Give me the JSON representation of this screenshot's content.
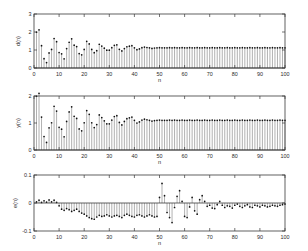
{
  "figure": {
    "background": "#ffffff",
    "axis_color": "#3a3a3a",
    "stem_color": "#6f6f6f",
    "marker_color": "#111111"
  },
  "chart_data": [
    {
      "type": "line",
      "name": "desired-signal",
      "title": "",
      "xlabel": "n",
      "ylabel": "d(n)",
      "xlim": [
        0,
        100
      ],
      "ylim": [
        0,
        3
      ],
      "xticks": [
        0,
        10,
        20,
        30,
        40,
        50,
        60,
        70,
        80,
        90,
        100
      ],
      "xticklabels": [
        "0",
        "10",
        "20",
        "30",
        "40",
        "50",
        "60",
        "70",
        "80",
        "90",
        "100"
      ],
      "yticks": [
        0,
        1,
        2,
        3
      ],
      "yticklabels": [
        "0",
        "1",
        "2",
        "3"
      ],
      "grid": false,
      "legend": "none",
      "marker": "dot",
      "x": [
        1,
        2,
        3,
        4,
        5,
        6,
        7,
        8,
        9,
        10,
        11,
        12,
        13,
        14,
        15,
        16,
        17,
        18,
        19,
        20,
        21,
        22,
        23,
        24,
        25,
        26,
        27,
        28,
        29,
        30,
        31,
        32,
        33,
        34,
        35,
        36,
        37,
        38,
        39,
        40,
        41,
        42,
        43,
        44,
        45,
        46,
        47,
        48,
        49,
        50,
        51,
        52,
        53,
        54,
        55,
        56,
        57,
        58,
        59,
        60,
        61,
        62,
        63,
        64,
        65,
        66,
        67,
        68,
        69,
        70,
        71,
        72,
        73,
        74,
        75,
        76,
        77,
        78,
        79,
        80,
        81,
        82,
        83,
        84,
        85,
        86,
        87,
        88,
        89,
        90,
        91,
        92,
        93,
        94,
        95,
        96,
        97,
        98,
        99,
        100
      ],
      "values": [
        1.99,
        2.12,
        1.24,
        0.52,
        0.3,
        0.84,
        1.03,
        1.64,
        1.46,
        0.86,
        0.79,
        0.51,
        1.08,
        1.43,
        1.62,
        1.27,
        1.19,
        0.8,
        0.73,
        1.03,
        1.48,
        1.34,
        1.03,
        0.85,
        0.96,
        1.32,
        1.22,
        1.1,
        0.99,
        0.99,
        1.13,
        1.26,
        1.29,
        1.04,
        0.95,
        1.08,
        1.18,
        1.21,
        1.24,
        1.12,
        1.02,
        1.06,
        1.13,
        1.16,
        1.14,
        1.12,
        1.09,
        1.11,
        1.12,
        1.13,
        1.12,
        1.12,
        1.12,
        1.13,
        1.12,
        1.13,
        1.12,
        1.12,
        1.13,
        1.12,
        1.12,
        1.13,
        1.12,
        1.12,
        1.13,
        1.12,
        1.12,
        1.13,
        1.12,
        1.12,
        1.13,
        1.12,
        1.12,
        1.13,
        1.12,
        1.12,
        1.13,
        1.12,
        1.12,
        1.13,
        1.12,
        1.12,
        1.13,
        1.12,
        1.12,
        1.13,
        1.12,
        1.12,
        1.13,
        1.12,
        1.12,
        1.13,
        1.12,
        1.12,
        1.13,
        1.12,
        1.12,
        1.13,
        1.12,
        1.12
      ]
    },
    {
      "type": "line",
      "name": "output-signal",
      "title": "",
      "xlabel": "n",
      "ylabel": "y(n)",
      "xlim": [
        0,
        100
      ],
      "ylim": [
        0,
        2
      ],
      "xticks": [
        0,
        10,
        20,
        30,
        40,
        50,
        60,
        70,
        80,
        90,
        100
      ],
      "xticklabels": [
        "0",
        "10",
        "20",
        "30",
        "40",
        "50",
        "60",
        "70",
        "80",
        "90",
        "100"
      ],
      "yticks": [
        0,
        1,
        2
      ],
      "yticklabels": [
        "0",
        "1",
        "2"
      ],
      "grid": false,
      "legend": "none",
      "marker": "dot",
      "x": [
        1,
        2,
        3,
        4,
        5,
        6,
        7,
        8,
        9,
        10,
        11,
        12,
        13,
        14,
        15,
        16,
        17,
        18,
        19,
        20,
        21,
        22,
        23,
        24,
        25,
        26,
        27,
        28,
        29,
        30,
        31,
        32,
        33,
        34,
        35,
        36,
        37,
        38,
        39,
        40,
        41,
        42,
        43,
        44,
        45,
        46,
        47,
        48,
        49,
        50,
        51,
        52,
        53,
        54,
        55,
        56,
        57,
        58,
        59,
        60,
        61,
        62,
        63,
        64,
        65,
        66,
        67,
        68,
        69,
        70,
        71,
        72,
        73,
        74,
        75,
        76,
        77,
        78,
        79,
        80,
        81,
        82,
        83,
        84,
        85,
        86,
        87,
        88,
        89,
        90,
        91,
        92,
        93,
        94,
        95,
        96,
        97,
        98,
        99,
        100
      ],
      "values": [
        1.99,
        2.1,
        1.22,
        0.5,
        0.28,
        0.82,
        1.01,
        1.62,
        1.44,
        0.84,
        0.77,
        0.49,
        1.06,
        1.41,
        1.6,
        1.25,
        1.17,
        0.78,
        0.71,
        1.01,
        1.46,
        1.32,
        1.01,
        0.83,
        0.94,
        1.3,
        1.2,
        1.08,
        0.97,
        0.97,
        1.11,
        1.24,
        1.27,
        1.02,
        0.93,
        1.06,
        1.16,
        1.19,
        1.22,
        1.1,
        1.0,
        1.04,
        1.11,
        1.14,
        1.12,
        1.1,
        1.07,
        1.09,
        1.1,
        1.11,
        1.1,
        1.1,
        1.1,
        1.11,
        1.1,
        1.11,
        1.1,
        1.1,
        1.11,
        1.1,
        1.1,
        1.11,
        1.1,
        1.1,
        1.11,
        1.1,
        1.1,
        1.11,
        1.1,
        1.1,
        1.11,
        1.1,
        1.1,
        1.11,
        1.1,
        1.1,
        1.11,
        1.1,
        1.1,
        1.11,
        1.1,
        1.1,
        1.11,
        1.1,
        1.1,
        1.11,
        1.1,
        1.1,
        1.11,
        1.1,
        1.1,
        1.11,
        1.1,
        1.1,
        1.11,
        1.1,
        1.1,
        1.11,
        1.1,
        1.1
      ]
    },
    {
      "type": "line",
      "name": "error-signal",
      "title": "",
      "xlabel": "n",
      "ylabel": "e(n)",
      "xlim": [
        0,
        100
      ],
      "ylim": [
        -0.1,
        0.1
      ],
      "xticks": [
        0,
        10,
        20,
        30,
        40,
        50,
        60,
        70,
        80,
        90,
        100
      ],
      "xticklabels": [
        "0",
        "10",
        "20",
        "30",
        "40",
        "50",
        "60",
        "70",
        "80",
        "90",
        "100"
      ],
      "yticks": [
        -0.1,
        0,
        0.1
      ],
      "yticklabels": [
        "-0.1",
        "0",
        "0.1"
      ],
      "grid": false,
      "legend": "none",
      "marker": "dot",
      "x": [
        1,
        2,
        3,
        4,
        5,
        6,
        7,
        8,
        9,
        10,
        11,
        12,
        13,
        14,
        15,
        16,
        17,
        18,
        19,
        20,
        21,
        22,
        23,
        24,
        25,
        26,
        27,
        28,
        29,
        30,
        31,
        32,
        33,
        34,
        35,
        36,
        37,
        38,
        39,
        40,
        41,
        42,
        43,
        44,
        45,
        46,
        47,
        48,
        49,
        50,
        51,
        52,
        53,
        54,
        55,
        56,
        57,
        58,
        59,
        60,
        61,
        62,
        63,
        64,
        65,
        66,
        67,
        68,
        69,
        70,
        71,
        72,
        73,
        74,
        75,
        76,
        77,
        78,
        79,
        80,
        81,
        82,
        83,
        84,
        85,
        86,
        87,
        88,
        89,
        90,
        91,
        92,
        93,
        94,
        95,
        96,
        97,
        98,
        99,
        100
      ],
      "values": [
        0.004,
        0.01,
        0.002,
        0.008,
        0.003,
        0.011,
        0.004,
        0.01,
        0.002,
        -0.01,
        -0.022,
        -0.026,
        -0.02,
        -0.024,
        -0.03,
        -0.026,
        -0.022,
        -0.03,
        -0.036,
        -0.04,
        -0.046,
        -0.052,
        -0.056,
        -0.058,
        -0.05,
        -0.044,
        -0.048,
        -0.046,
        -0.042,
        -0.046,
        -0.05,
        -0.046,
        -0.044,
        -0.048,
        -0.052,
        -0.044,
        -0.04,
        -0.044,
        -0.048,
        -0.05,
        -0.044,
        -0.042,
        -0.046,
        -0.05,
        -0.046,
        -0.042,
        -0.046,
        -0.05,
        -0.048,
        0.02,
        0.07,
        0.026,
        -0.034,
        -0.052,
        -0.07,
        -0.016,
        0.024,
        0.044,
        0.006,
        -0.048,
        -0.052,
        -0.014,
        0.02,
        -0.028,
        -0.04,
        0.012,
        0.026,
        0.006,
        -0.012,
        -0.008,
        -0.018,
        -0.02,
        -0.006,
        0.006,
        -0.008,
        -0.016,
        -0.01,
        -0.012,
        -0.018,
        -0.008,
        -0.004,
        -0.012,
        -0.016,
        -0.01,
        -0.006,
        -0.014,
        -0.016,
        -0.008,
        -0.01,
        -0.014,
        -0.008,
        -0.01,
        -0.014,
        -0.012,
        -0.008,
        -0.01,
        -0.012,
        -0.008,
        -0.006,
        -0.004
      ]
    }
  ]
}
